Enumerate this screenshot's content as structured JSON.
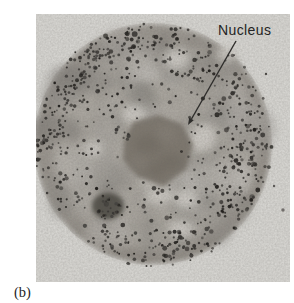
{
  "figure": {
    "kind": "electron-micrograph-of-cell",
    "annotations": {
      "nucleus_label": "Nucleus"
    },
    "subfigure_label": "(b)",
    "colors": {
      "page_bg": "#ffffff",
      "photo_bg": "#d7d6d2",
      "cell_center": "#aca8a1",
      "cell_edge": "#8f8a82",
      "cell_rim": "#7b766f",
      "nucleus_fill": "#7c766d",
      "nucleus_shadow": "#6b655c",
      "granule_dark": "#262522",
      "light_patch": "#d6d3cd",
      "label_text": "#242424",
      "leader_line": "#2e2d2b",
      "caption_text": "#1f1f1f"
    }
  }
}
